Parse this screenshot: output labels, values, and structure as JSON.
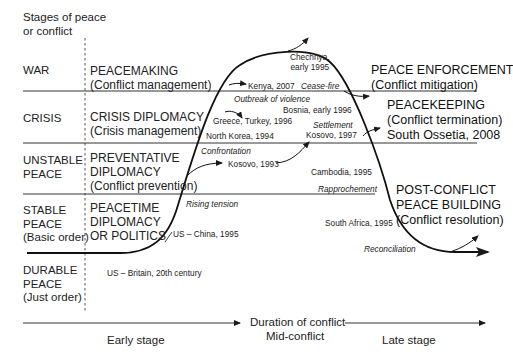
{
  "title": "Stages of peace or conflict",
  "y_axis_title": [
    "Stages of peace",
    "or conflict"
  ],
  "stages": [
    {
      "id": "war",
      "lines": [
        "WAR"
      ]
    },
    {
      "id": "crisis",
      "lines": [
        "CRISIS"
      ]
    },
    {
      "id": "unstable",
      "lines": [
        "UNSTABLE",
        "PEACE"
      ]
    },
    {
      "id": "stable",
      "lines": [
        "STABLE",
        "PEACE",
        "(Basic order)"
      ]
    },
    {
      "id": "durable",
      "lines": [
        "DURABLE",
        "PEACE",
        "(Just order)"
      ]
    }
  ],
  "early_modes": [
    {
      "id": "peacemaking",
      "lines": [
        "PEACEMAKING",
        "(Conflict management)"
      ]
    },
    {
      "id": "crisis-diplomacy",
      "lines": [
        "CRISIS DIPLOMACY",
        "(Crisis management)"
      ]
    },
    {
      "id": "preventative",
      "lines": [
        "PREVENTATIVE",
        "DIPLOMACY",
        "(Conflict prevention)"
      ]
    },
    {
      "id": "peacetime",
      "lines": [
        "PEACETIME",
        "DIPLOMACY",
        "OR POLITICS"
      ]
    }
  ],
  "late_modes": [
    {
      "id": "peace-enforcement",
      "lines": [
        "PEACE ENFORCEMENT",
        "(Conflict mitigation)"
      ]
    },
    {
      "id": "peacekeeping",
      "lines": [
        "PEACEKEEPING",
        "(Conflict termination)",
        "South Ossetia, 2008"
      ]
    },
    {
      "id": "post-conflict",
      "lines": [
        "POST-CONFLICT",
        "PEACE BUILDING",
        "(Conflict resolution)"
      ]
    }
  ],
  "examples": {
    "chechnya": [
      "Chechnya,",
      "early 1995"
    ],
    "kenya": "Kenya, 2007",
    "greece_turkey": "Greece, Turkey, 1996",
    "north_korea": "North Korea, 1994",
    "kosovo_1993": "Kosovo, 1993",
    "bosnia": "Bosnia, early 1996",
    "kosovo_1997": "Kosovo, 1997",
    "cambodia": "Cambodia, 1995",
    "south_africa": "South Africa, 1995",
    "us_china": "US – China, 1995",
    "us_britain": "US – Britain, 20th century"
  },
  "transitions": {
    "cease_fire": "Cease-fire",
    "outbreak": "Outbreak of violence",
    "settlement": "Settlement",
    "confrontation": "Confrontation",
    "rapprochement": "Rapprochement",
    "rising_tension": "Rising tension",
    "reconciliation": "Reconciliation"
  },
  "x_axis": {
    "title": "Duration of conflict",
    "early": "Early stage",
    "mid": "Mid-conflict",
    "late": "Late stage"
  },
  "colors": {
    "line": "#1a1a1a",
    "text": "#222222",
    "background": "#ffffff"
  }
}
